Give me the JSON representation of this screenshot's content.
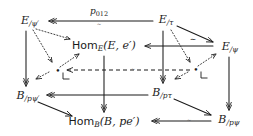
{
  "diagram": {
    "width": 253,
    "height": 136,
    "background": "#ffffff",
    "ink": "#1b1b1b",
    "nodes": [
      {
        "id": "E_psi_prime",
        "label": "E",
        "sub": "/ψ′",
        "x": 30,
        "y": 21,
        "kind": "math"
      },
      {
        "id": "E_tau",
        "label": "E",
        "sub": "/τ",
        "x": 166,
        "y": 20,
        "kind": "math"
      },
      {
        "id": "Hom_E",
        "label": "Hom",
        "sub": "E",
        "args": "(E, e′)",
        "x": 104,
        "y": 46,
        "kind": "hom"
      },
      {
        "id": "E_psi",
        "label": "E",
        "sub": "/ψ",
        "x": 230,
        "y": 47,
        "kind": "math"
      },
      {
        "id": "B_p_psi_prime",
        "label": "B",
        "sub": "/pψ′",
        "x": 28,
        "y": 96,
        "kind": "math"
      },
      {
        "id": "B_p_tau",
        "label": "B",
        "sub": "/pτ",
        "x": 162,
        "y": 93,
        "kind": "math"
      },
      {
        "id": "Hom_B",
        "label": "Hom",
        "sub": "B",
        "args": "(B, pe′)",
        "x": 104,
        "y": 122,
        "kind": "hom"
      },
      {
        "id": "B_p_psi",
        "label": "B",
        "sub": "/pψ",
        "x": 229,
        "y": 120,
        "kind": "math"
      },
      {
        "id": "dot_left",
        "label": "•",
        "x": 58,
        "y": 71,
        "kind": "dot"
      },
      {
        "id": "dot_right",
        "label": "•",
        "x": 196,
        "y": 70,
        "kind": "dot"
      }
    ],
    "edge_labels": [
      {
        "id": "p012",
        "text": "p",
        "subscript": "012",
        "x": 99,
        "y": 12,
        "kind": "p"
      },
      {
        "id": "p012_tilde",
        "text": "∼",
        "x": 99,
        "y": 21,
        "kind": "tilde_small"
      },
      {
        "id": "tilde_top_right",
        "text": "∼",
        "x": 193,
        "y": 40,
        "kind": "tilde"
      },
      {
        "id": "tilde_mid",
        "text": "∼",
        "x": 133,
        "y": 70,
        "kind": "tilde_small"
      },
      {
        "id": "tilde_bottom",
        "text": "∼",
        "x": 189,
        "y": 121,
        "kind": "tilde_small"
      }
    ],
    "edges": [
      {
        "id": "E_tau-to-E_psi_prime",
        "style": "solid",
        "head": "double",
        "note": "top horizontal, leftward"
      },
      {
        "id": "E_tau-to-E_psi",
        "style": "solid",
        "head": "single",
        "note": "top-right diagonal"
      },
      {
        "id": "E_psi-to-Hom_E",
        "style": "solid",
        "head": "single",
        "note": "horizontal leftward into Hom_E"
      },
      {
        "id": "E_psi_prime-to-Hom_E",
        "style": "dotted",
        "head": "single",
        "note": "diagonal down-right"
      },
      {
        "id": "E_psi_prime-to-dot_left",
        "style": "dotted",
        "head": "single",
        "note": "diagonal down-right"
      },
      {
        "id": "dot_left-to-Hom_E",
        "style": "dotted",
        "head": "single",
        "note": "diagonal up-right"
      },
      {
        "id": "E_tau-to-dot_right",
        "style": "dotted",
        "head": "single",
        "note": "diagonal down-right"
      },
      {
        "id": "dot_right-to-E_psi",
        "style": "dotted",
        "head": "single",
        "note": "diagonal up-right"
      },
      {
        "id": "dot_right-to-dot_left",
        "style": "dashed",
        "head": "single",
        "note": "horizontal dashed leftward"
      },
      {
        "id": "E_psi_prime-to-B_p_psi_prime",
        "style": "solid",
        "head": "double",
        "note": "left vertical"
      },
      {
        "id": "E_tau-to-B_p_tau",
        "style": "solid",
        "head": "double",
        "note": "middle-right vertical"
      },
      {
        "id": "E_psi-to-B_p_psi",
        "style": "solid",
        "head": "double",
        "note": "right vertical"
      },
      {
        "id": "Hom_E-to-Hom_B",
        "style": "solid",
        "head": "double",
        "note": "center vertical"
      },
      {
        "id": "B_p_tau-to-B_p_psi_prime",
        "style": "solid",
        "head": "double",
        "note": "bottom horizontal leftward"
      },
      {
        "id": "B_p_tau-to-B_p_psi",
        "style": "solid",
        "head": "single",
        "note": "bottom-right diagonal"
      },
      {
        "id": "B_p_psi_prime-to-Hom_B",
        "style": "solid",
        "head": "single",
        "note": "bottom-left diagonal"
      },
      {
        "id": "B_p_psi-to-Hom_B",
        "style": "solid",
        "head": "double",
        "note": "bottom horizontal leftward"
      },
      {
        "id": "dot_left-to-B_p_psi_prime",
        "style": "dotted",
        "head": "single",
        "note": "short down-left tick"
      },
      {
        "id": "dot_right-to-B_p_tau",
        "style": "dotted",
        "head": "single",
        "note": "short down-left tick"
      }
    ],
    "pullback_marks": [
      {
        "id": "pullback-corner-left",
        "x": 66,
        "y": 78
      },
      {
        "id": "pullback-corner-right",
        "x": 204,
        "y": 77
      }
    ]
  }
}
